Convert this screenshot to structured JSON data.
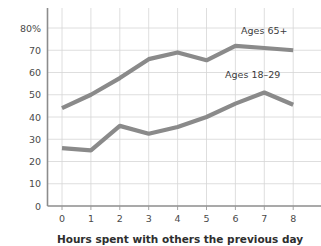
{
  "chart_data": {
    "type": "line",
    "title": "",
    "xlabel": "Hours spent with others the previous day",
    "ylabel": "",
    "x": [
      0,
      1,
      2,
      3,
      4,
      5,
      6,
      7,
      8
    ],
    "xlim": [
      0,
      8
    ],
    "ylim": [
      0,
      80
    ],
    "grid": true,
    "legend_position": "inline-annotation",
    "y_ticks": [
      "0",
      "10",
      "20",
      "30",
      "40",
      "50",
      "60",
      "70",
      "80%"
    ],
    "y_tick_values": [
      0,
      10,
      20,
      30,
      40,
      50,
      60,
      70,
      80
    ],
    "x_ticks": [
      "0",
      "1",
      "2",
      "3",
      "4",
      "5",
      "6",
      "7",
      "8"
    ],
    "series": [
      {
        "name": "Ages 65+",
        "annotation": "Ages 65+",
        "color": "#8a8a8a",
        "values": [
          44,
          50,
          57.5,
          66,
          69,
          65.5,
          72,
          71,
          70
        ]
      },
      {
        "name": "Ages 18-29",
        "annotation": "Ages 18–29",
        "color": "#8a8a8a",
        "values": [
          26,
          25,
          36,
          32.5,
          35.5,
          40,
          46,
          51,
          45.5
        ]
      }
    ],
    "annotations": [
      {
        "text": "Ages 65+",
        "x": 7.0,
        "y": 77.5
      },
      {
        "text": "Ages 18–29",
        "x": 6.6,
        "y": 57.5
      }
    ]
  },
  "colors": {
    "line": "#8a8a8a",
    "grid": "#d6d6d6",
    "axis": "#8c8c8c",
    "background": "#ffffff",
    "text": "#3a3a3a"
  }
}
